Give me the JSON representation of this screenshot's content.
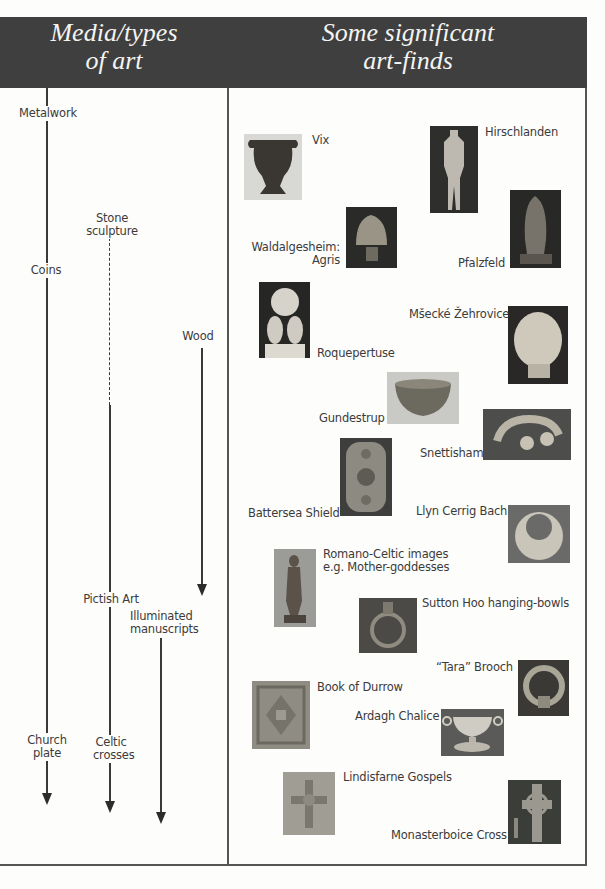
{
  "header": {
    "left_title_line1": "Media/types",
    "left_title_line2": "of art",
    "right_title_line1": "Some significant",
    "right_title_line2": "art-finds",
    "background_color": "#3f3f3f"
  },
  "media": [
    {
      "id": "metalwork",
      "label": "Metalwork"
    },
    {
      "id": "stone-sculpture",
      "label": "Stone sculpture"
    },
    {
      "id": "coins",
      "label": "Coins"
    },
    {
      "id": "wood",
      "label": "Wood"
    },
    {
      "id": "pictish-art",
      "label": "Pictish Art"
    },
    {
      "id": "illuminated-manuscripts",
      "label_line1": "Illuminated",
      "label_line2": "manuscripts"
    },
    {
      "id": "church-plate",
      "label_line1": "Church",
      "label_line2": "plate"
    },
    {
      "id": "celtic-crosses",
      "label_line1": "Celtic",
      "label_line2": "crosses"
    }
  ],
  "finds": [
    {
      "id": "vix",
      "label": "Vix"
    },
    {
      "id": "hirschlanden",
      "label": "Hirschlanden"
    },
    {
      "id": "waldalgesheim",
      "label_line1": "Waldalgesheim:",
      "label_line2": "Agris"
    },
    {
      "id": "pfalzfeld",
      "label": "Pfalzfeld"
    },
    {
      "id": "roquepertuse",
      "label": "Roquepertuse"
    },
    {
      "id": "msecke-zehrovice",
      "label": "Mšecké Žehrovice"
    },
    {
      "id": "gundestrup",
      "label": "Gundestrup"
    },
    {
      "id": "snettisham",
      "label": "Snettisham"
    },
    {
      "id": "battersea-shield",
      "label": "Battersea Shield"
    },
    {
      "id": "llyn-cerrig-bach",
      "label": "Llyn Cerrig Bach"
    },
    {
      "id": "romano-celtic",
      "label_line1": "Romano-Celtic images",
      "label_line2": "e.g. Mother-goddesses"
    },
    {
      "id": "sutton-hoo",
      "label": "Sutton Hoo hanging-bowls"
    },
    {
      "id": "tara-brooch",
      "label": "“Tara” Brooch"
    },
    {
      "id": "book-of-durrow",
      "label": "Book of Durrow"
    },
    {
      "id": "ardagh-chalice",
      "label": "Ardagh Chalice"
    },
    {
      "id": "lindisfarne-gospels",
      "label": "Lindisfarne Gospels"
    },
    {
      "id": "monasterboice-cross",
      "label": "Monasterboice Cross"
    }
  ]
}
